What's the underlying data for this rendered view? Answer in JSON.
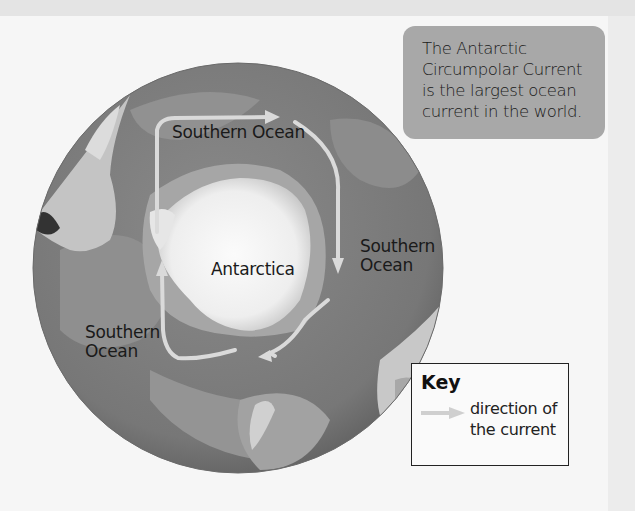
{
  "map": {
    "title": "Antarctic Circumpolar Current",
    "labels": {
      "top": "Southern Ocean",
      "right_line1": "Southern",
      "right_line2": "Ocean",
      "left_line1": "Southern",
      "left_line2": "Ocean",
      "center": "Antarctica"
    },
    "current_direction": "clockwise around Antarctica",
    "colors": {
      "ocean_deep": "#7a7a7a",
      "ocean_shallow": "#9a9a9a",
      "land": "#c8c8c8",
      "ice": "#f2f2f2",
      "current_arrow": "#d8d8d8"
    }
  },
  "fact_box": {
    "lines": [
      "The Antarctic",
      "Circumpolar Current",
      "is the largest ocean",
      "current in the world."
    ]
  },
  "key": {
    "title": "Key",
    "arrow_icon": "arrow-right-icon",
    "description_line1": "direction of",
    "description_line2": "the current"
  }
}
